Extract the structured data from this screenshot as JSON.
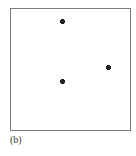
{
  "figure": {
    "label": "(b)",
    "frame": {
      "left": 10,
      "top": 8,
      "width": 121,
      "height": 123,
      "border_color": "#7a7a7a"
    },
    "point_color": "#222222",
    "points": [
      {
        "x": 62,
        "y": 21
      },
      {
        "x": 62,
        "y": 81
      },
      {
        "x": 108,
        "y": 67
      }
    ]
  }
}
